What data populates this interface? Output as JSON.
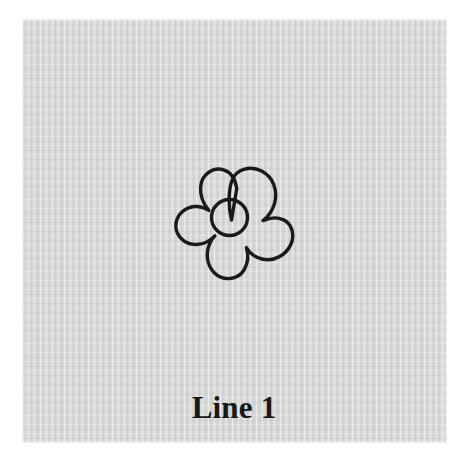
{
  "canvas": {
    "width": 468,
    "height": 461,
    "background_color": "#ffffff"
  },
  "card": {
    "name": "textured-paper-card",
    "background_color": "#d8d8d8",
    "texture": "vertical-woven-fabric-stripes",
    "bounds": {
      "x": 22,
      "y": 19,
      "width": 425,
      "height": 424
    }
  },
  "artwork": {
    "name": "flower-outline",
    "description": "five-petal flower outline drawing with round center",
    "stroke_color": "#1a1a1a",
    "fill_color": "none",
    "stroke_width": 3.4,
    "center": {
      "x": 231,
      "y": 227
    },
    "petal_count": 5,
    "center_circle": {
      "cx": 229,
      "cy": 217,
      "r": 18
    },
    "bounds": {
      "x": 176,
      "y": 170,
      "width": 111,
      "height": 115
    }
  },
  "caption": {
    "name": "caption-text",
    "text": "Line 1",
    "color": "#16181a",
    "font_size_px": 31,
    "font_weight": "bold",
    "font_style": "serif",
    "align": "center"
  }
}
